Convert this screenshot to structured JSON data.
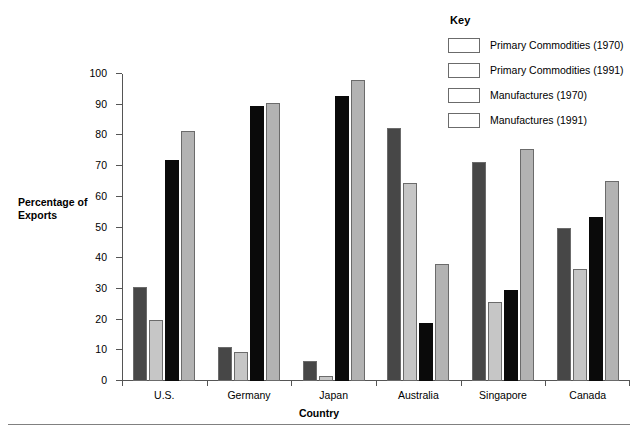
{
  "chart_data": {
    "type": "bar",
    "title": "",
    "xlabel": "Country",
    "ylabel": "Percentage of Exports",
    "ylim": [
      0,
      100
    ],
    "yticks": [
      0,
      10,
      20,
      30,
      40,
      50,
      60,
      70,
      80,
      90,
      100
    ],
    "grid": false,
    "legend_position": "top-right",
    "legend_title": "Key",
    "categories": [
      "U.S.",
      "Germany",
      "Japan",
      "Australia",
      "Singapore",
      "Canada"
    ],
    "series": [
      {
        "name": "Primary Commodities (1970)",
        "color": "#474747",
        "values": [
          30.5,
          11,
          6.5,
          82.5,
          71.5,
          50
        ]
      },
      {
        "name": "Primary Commodities (1991)",
        "color": "#c6c6c6",
        "values": [
          20,
          9.5,
          1.5,
          64.5,
          25.8,
          36.5
        ]
      },
      {
        "name": "Manufactures (1970)",
        "color": "#0a0a0a",
        "values": [
          72,
          89.5,
          93,
          18.8,
          29.8,
          53.5
        ]
      },
      {
        "name": "Manufactures (1991)",
        "color": "#b3b3b3",
        "values": [
          81.5,
          90.5,
          98,
          38,
          75.5,
          65
        ]
      }
    ]
  }
}
